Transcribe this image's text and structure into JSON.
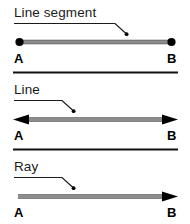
{
  "figure": {
    "title_alt": "Line segment, line and ray diagram",
    "background_color": "#ffffff",
    "line_color": "#8d8d8d",
    "line_edge_color": "#5a5a5a",
    "marker_color": "#000000",
    "divider_color": "#111111",
    "text_color": "#1a1a1a"
  },
  "panels": [
    {
      "id": "line-segment",
      "title": "Line segment",
      "left_label": "A",
      "right_label": "B",
      "left_end": "dot",
      "right_end": "dot"
    },
    {
      "id": "line",
      "title": "Line",
      "left_label": "A",
      "right_label": "B",
      "left_end": "arrow",
      "right_end": "arrow"
    },
    {
      "id": "ray",
      "title": "Ray",
      "left_label": "A",
      "right_label": "B",
      "left_end": "flat",
      "right_end": "arrow"
    }
  ],
  "dividers": [
    {
      "id": "divider-1",
      "label": "panel-divider"
    },
    {
      "id": "divider-2",
      "label": "panel-divider"
    }
  ]
}
